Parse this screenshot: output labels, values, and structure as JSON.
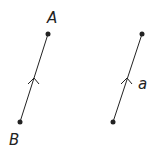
{
  "diagram": {
    "left_vector": {
      "start_label": "B",
      "end_label": "A",
      "start": [
        20,
        122
      ],
      "end": [
        48,
        34
      ]
    },
    "right_vector": {
      "label": "a",
      "start": [
        113,
        122
      ],
      "end": [
        142,
        34
      ]
    },
    "colors": {
      "stroke": "#222222",
      "background": "#ffffff"
    }
  }
}
